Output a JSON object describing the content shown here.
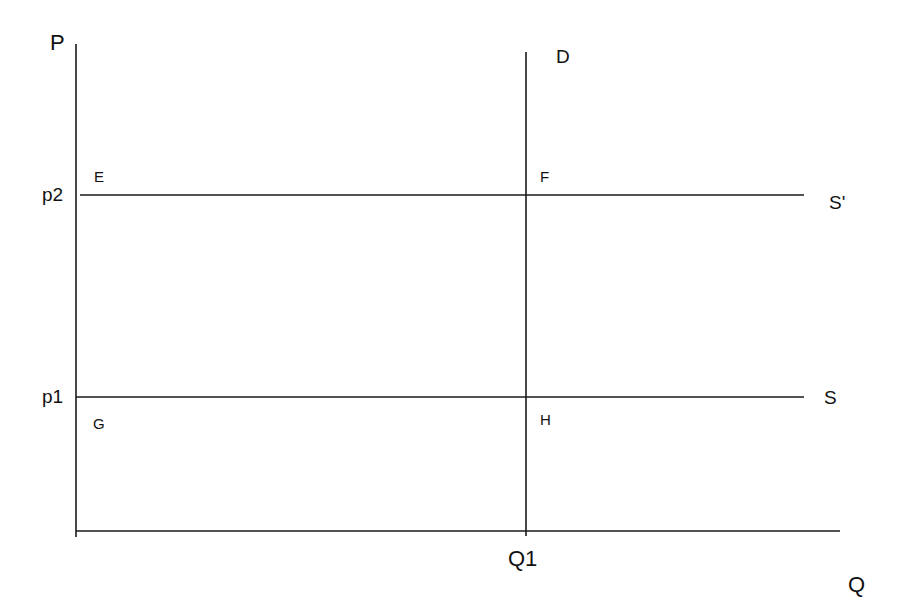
{
  "diagram": {
    "type": "supply-demand",
    "axes": {
      "y_label": "P",
      "x_label": "Q"
    },
    "price_levels": [
      {
        "label": "p1",
        "curve": "S"
      },
      {
        "label": "p2",
        "curve": "S'"
      }
    ],
    "quantity_levels": [
      {
        "label": "Q1",
        "curve": "D"
      }
    ],
    "curves": {
      "demand": "D",
      "supply": "S",
      "supply_shifted": "S'"
    },
    "points": {
      "E": "E",
      "F": "F",
      "G": "G",
      "H": "H"
    },
    "colors": {
      "line": "#1a1a1a",
      "background": "#ffffff"
    }
  }
}
